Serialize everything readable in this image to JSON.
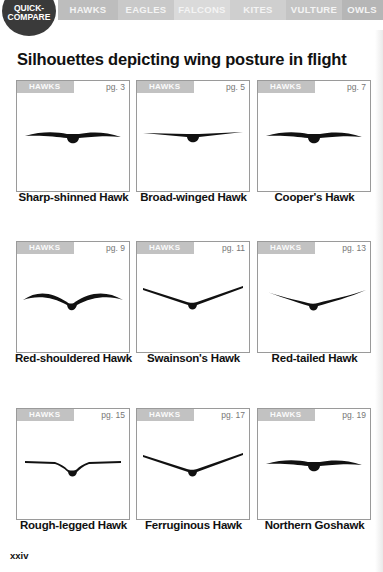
{
  "nav": {
    "quick_compare": "QUICK-\nCOMPARE",
    "quick_compare_line1": "QUICK-",
    "quick_compare_line2": "COMPARE",
    "tabs": [
      {
        "label": "HAWKS"
      },
      {
        "label": "EAGLES"
      },
      {
        "label": "FALCONS"
      },
      {
        "label": "KITES"
      },
      {
        "label": "VULTURE"
      },
      {
        "label": "OWLS"
      }
    ]
  },
  "title": "Silhouettes depicting wing posture in flight",
  "cards": [
    {
      "category": "HAWKS",
      "page": "pg. 3",
      "name": "Sharp-shinned Hawk",
      "silhouette": "flat-wave"
    },
    {
      "category": "HAWKS",
      "page": "pg. 5",
      "name": "Broad-winged Hawk",
      "silhouette": "flat"
    },
    {
      "category": "HAWKS",
      "page": "pg. 7",
      "name": "Cooper's Hawk",
      "silhouette": "flat-wave"
    },
    {
      "category": "HAWKS",
      "page": "pg. 9",
      "name": "Red-shouldered Hawk",
      "silhouette": "bowed"
    },
    {
      "category": "HAWKS",
      "page": "pg. 11",
      "name": "Swainson's Hawk",
      "silhouette": "dihedral"
    },
    {
      "category": "HAWKS",
      "page": "pg. 13",
      "name": "Red-tailed Hawk",
      "silhouette": "slight-dihedral"
    },
    {
      "category": "HAWKS",
      "page": "pg. 15",
      "name": "Rough-legged Hawk",
      "silhouette": "modified-dihedral"
    },
    {
      "category": "HAWKS",
      "page": "pg. 17",
      "name": "Ferruginous Hawk",
      "silhouette": "dihedral"
    },
    {
      "category": "HAWKS",
      "page": "pg. 19",
      "name": "Northern Goshawk",
      "silhouette": "flat-wave"
    }
  ],
  "folio": "xxiv"
}
